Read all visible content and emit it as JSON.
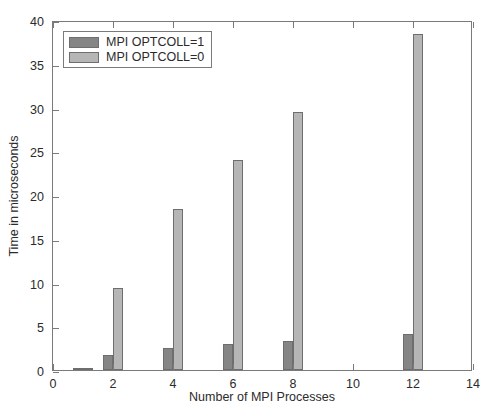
{
  "chart_data": {
    "type": "bar",
    "title": "",
    "xlabel": "Number of MPI Processes",
    "ylabel": "Time in microseconds",
    "xlim": [
      0,
      14
    ],
    "ylim": [
      0,
      40
    ],
    "xticks": [
      0,
      2,
      4,
      6,
      8,
      10,
      12,
      14
    ],
    "yticks": [
      0,
      5,
      10,
      15,
      20,
      25,
      30,
      35,
      40
    ],
    "grid": false,
    "legend_position": "upper-left",
    "categories": [
      1,
      2,
      4,
      6,
      8,
      12
    ],
    "series": [
      {
        "name": "MPI OPTCOLL=1",
        "color": "#858585",
        "values": [
          0.2,
          1.7,
          2.5,
          3.0,
          3.3,
          4.1
        ]
      },
      {
        "name": "MPI OPTCOLL=0",
        "color": "#b6b6b6",
        "values": [
          0.2,
          9.4,
          18.4,
          24.0,
          29.5,
          38.4
        ]
      }
    ]
  },
  "legend": {
    "items": [
      {
        "label": "MPI OPTCOLL=1"
      },
      {
        "label": "MPI OPTCOLL=0"
      }
    ]
  },
  "axes": {
    "x_title": "Number of MPI Processes",
    "y_title": "Time in microseconds"
  }
}
